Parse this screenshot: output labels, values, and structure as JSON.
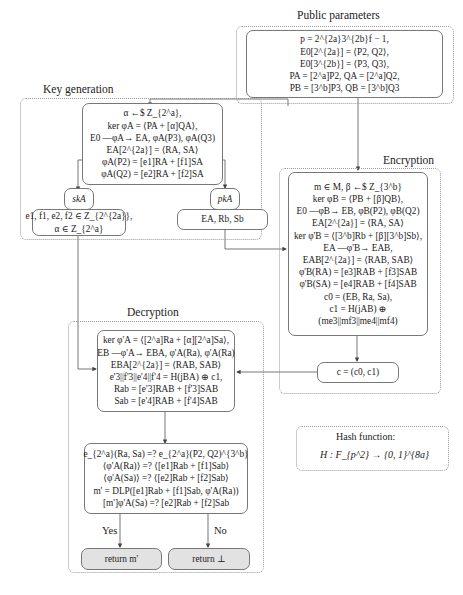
{
  "public_parameters": {
    "title": "Public parameters",
    "lines": [
      "p = 2^{2a}3^{2b}f − 1,",
      "E0[2^{2a}] = ⟨P2, Q2⟩,",
      "E0[3^{2b}] = ⟨P3, Q3⟩,",
      "PA = [2^a]P2, QA = [2^a]Q2,",
      "PB = [3^b]P3, QB = [3^b]Q3"
    ]
  },
  "key_generation": {
    "title": "Key generation",
    "main_lines": [
      "α ←$ Z_{2^a},",
      "ker φA = ⟨PA + [α]QA⟩,",
      "E0 —φA→ EA, φA(P3), φA(Q3)",
      "EA[2^{2a}] = ⟨RA, SA⟩",
      "φA(P2) = [e1]RA + [f1]SA",
      "φA(Q2) = [e2]RA + [f2]SA"
    ],
    "sk_label": "skA",
    "sk_lines": [
      "e1, f1, e2, f2 ∈ Z_{2^{2a}},",
      "α ∈ Z_{2^a}"
    ],
    "pk_label": "pkA",
    "pk_lines": [
      "EA, Rb, Sb"
    ]
  },
  "encryption": {
    "title": "Encryption",
    "lines": [
      "m ∈ M, β ←$ Z_{3^b}",
      "ker φB = ⟨PB + [β]QB⟩,",
      "E0 —φB→ EB, φB(P2), φB(Q2)",
      "EA[2^{2a}] = ⟨RA, SA⟩",
      "ker φ'B = ⟨[3^b]Rb + [β][3^b]Sb⟩,",
      "EA —φ'B→ EAB,",
      "EAB[2^{2a}] = ⟨RAB, SAB⟩",
      "φ'B(RA) = [e3]RAB + [f3]SAB",
      "φ'B(SA) = [e4]RAB + [f4]SAB",
      "c0 = (EB, Ra, Sa),",
      "c1 = H(jAB) ⊕",
      "(me3||mf3||me4||mf4)"
    ],
    "ciphertext": "c = (c0, c1)"
  },
  "decryption": {
    "title": "Decryption",
    "lines": [
      "ker φ'A = ⟨[2^a]Ra + [α][2^a]Sa⟩,",
      "EB —φ'A→ EBA, φ'A(Ra), φ'A(Ra)",
      "EBA[2^{2a}] = ⟨RAB, SAB⟩",
      "e'3||f'3||e'4||f'4 = H(jBA) ⊕ c1,",
      "Rab = [e'3]RAB + [f'3]SAB",
      "Sab = [e'4]RAB + [f'4]SAB"
    ],
    "check_lines": [
      "e_{2^a}(Ra, Sa) =? e_{2^a}(P2, Q2)^{3^b}",
      "⟨φ'A(Ra)⟩ =? ⟨[e1]Rab + [f1]Sab⟩",
      "⟨φ'A(Sa)⟩ =? ⟨[e2]Rab + [f2]Sab⟩",
      "m' = DLP([e1]Rab + [f1]Sab, φ'A(Ra))",
      "[m']φ'A(Sa) =? [e2]Rab + [f2]Sab"
    ],
    "yes_label": "Yes",
    "no_label": "No",
    "return_ok": "return m'",
    "return_fail": "return ⊥"
  },
  "hash_function": {
    "title": "Hash function:",
    "definition": "H : F_{p^2} → {0, 1}^{8a}"
  }
}
